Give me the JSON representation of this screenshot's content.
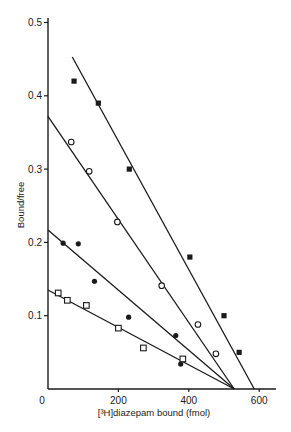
{
  "chart_data": {
    "type": "scatter",
    "title": "",
    "xlabel": "[³H]diazepam bound (fmol)",
    "ylabel": "Bound/free",
    "xlim": [
      0,
      640
    ],
    "ylim": [
      0,
      0.51
    ],
    "x_ticks": [
      0,
      200,
      400,
      600
    ],
    "x_tick_labels": [
      "0",
      "200",
      "400",
      "600"
    ],
    "y_ticks": [
      0.1,
      0.2,
      0.3,
      0.4,
      0.5
    ],
    "y_tick_labels": [
      "0.1",
      "0.2",
      "0.3",
      "0.4",
      "0.5"
    ],
    "grid": false,
    "legend": null,
    "series": [
      {
        "name": "filled squares",
        "marker": "square-filled",
        "points": [
          [
            74,
            0.42
          ],
          [
            143,
            0.39
          ],
          [
            231,
            0.3
          ],
          [
            403,
            0.18
          ],
          [
            500,
            0.1
          ],
          [
            543,
            0.05
          ]
        ],
        "fit_line": [
          [
            69,
            0.453
          ],
          [
            586,
            0.0
          ]
        ]
      },
      {
        "name": "open circles",
        "marker": "circle-open",
        "points": [
          [
            66,
            0.337
          ],
          [
            117,
            0.297
          ],
          [
            197,
            0.228
          ],
          [
            323,
            0.141
          ],
          [
            426,
            0.088
          ],
          [
            477,
            0.048
          ]
        ],
        "fit_line": [
          [
            0,
            0.372
          ],
          [
            529,
            0.0
          ]
        ]
      },
      {
        "name": "filled circles",
        "marker": "circle-filled",
        "points": [
          [
            43,
            0.199
          ],
          [
            86,
            0.198
          ],
          [
            132,
            0.147
          ],
          [
            229,
            0.098
          ],
          [
            363,
            0.073
          ],
          [
            377,
            0.034
          ]
        ],
        "fit_line": [
          [
            0,
            0.217
          ],
          [
            529,
            0.0
          ]
        ]
      },
      {
        "name": "open squares",
        "marker": "square-open",
        "points": [
          [
            29,
            0.131
          ],
          [
            55,
            0.121
          ],
          [
            109,
            0.114
          ],
          [
            200,
            0.083
          ],
          [
            271,
            0.056
          ],
          [
            383,
            0.041
          ]
        ],
        "fit_line": [
          [
            0,
            0.135
          ],
          [
            529,
            0.0
          ]
        ]
      }
    ]
  },
  "colors": {
    "ink": "#1a1a1a",
    "background": "#ffffff"
  }
}
